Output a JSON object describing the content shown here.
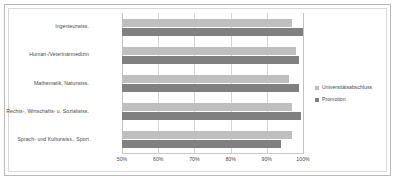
{
  "chart_data": {
    "type": "bar",
    "orientation": "horizontal",
    "title": "",
    "subtitle": "",
    "xlabel": "",
    "ylabel": "",
    "xlim": [
      50,
      100
    ],
    "xticks": [
      50,
      60,
      70,
      80,
      90,
      100
    ],
    "xtick_labels": [
      "50%",
      "60%",
      "70%",
      "80%",
      "90%",
      "100%"
    ],
    "grid": true,
    "legend_position": "right",
    "categories": [
      "Ingenieurwiss.",
      "Human-/Veterinärmedizin",
      "Mathematik, Naturwiss.",
      "Rechts-, Wirtschafts- u. Sozialwiss.",
      "Sprach- und Kulturwiss., Sport"
    ],
    "series": [
      {
        "name": "Universitätsabschluss",
        "color": "#bfbfbf",
        "values": [
          97,
          98,
          96,
          97,
          97
        ]
      },
      {
        "name": "Promotion",
        "color": "#808080",
        "values": [
          100,
          99,
          99,
          99.5,
          94
        ]
      }
    ]
  },
  "legend": {
    "items": [
      {
        "label": "Universitätsabschluss",
        "color": "#bfbfbf"
      },
      {
        "label": "Promotion",
        "color": "#808080"
      }
    ]
  },
  "colors": {
    "series_light": "#bfbfbf",
    "series_dark": "#808080",
    "gridline": "#d4d4d4",
    "frame_outer": "#b9b9b9",
    "frame_inner": "#d8d8d8",
    "text": "#4a4a4a",
    "background": "#ffffff"
  }
}
